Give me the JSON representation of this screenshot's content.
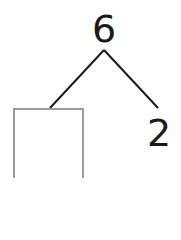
{
  "diagram": {
    "type": "number-bond",
    "whole": "6",
    "parts": [
      {
        "position": "left",
        "value": "",
        "is_blank": true
      },
      {
        "position": "right",
        "value": "2",
        "is_blank": false
      }
    ],
    "colors": {
      "text": "#1a1a1a",
      "lines": "#1a1a1a",
      "box_border": "#9a9a9a"
    }
  }
}
